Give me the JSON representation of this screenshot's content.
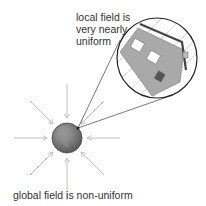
{
  "labels": {
    "local_line1": "local field is",
    "local_line2": "very nearly",
    "local_line3": "uniform",
    "global": "global field is non-uniform"
  },
  "colors": {
    "field_lines": "#b3b3b3",
    "globe": "#7a7a7a",
    "house": "#a6a6a6",
    "roof": "#555555",
    "circle": "#222222"
  }
}
